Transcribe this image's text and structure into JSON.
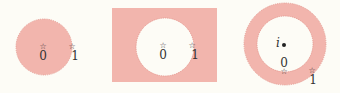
{
  "colors": {
    "background": "#fdfcf6",
    "region_fill": "#f2b5ad",
    "region_stroke": "#e2958d",
    "hole_fill": "#fdfcf6",
    "text": "#333333"
  },
  "panels": [
    {
      "name": "disk",
      "description": "Shaded open disk",
      "points": [
        {
          "symbol": "☆",
          "label": "0"
        },
        {
          "symbol": "☆",
          "label": "1"
        }
      ]
    },
    {
      "name": "disk-complement",
      "description": "Shaded exterior of disk (square region with disk removed)",
      "points": [
        {
          "symbol": "☆",
          "label": "0"
        },
        {
          "symbol": "☆",
          "label": "1"
        }
      ]
    },
    {
      "name": "annulus",
      "description": "Shaded annulus centered at i",
      "center": {
        "label": "i"
      },
      "points": [
        {
          "symbol": "☆",
          "label": "0"
        },
        {
          "symbol": "☆",
          "label": "1"
        }
      ]
    }
  ]
}
